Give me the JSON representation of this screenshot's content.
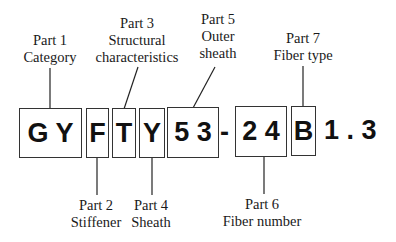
{
  "code": "GYFTY53-24B1.3",
  "segments": {
    "gy": "G Y",
    "f": "F",
    "t": "T",
    "y": "Y",
    "n53": "5 3",
    "dash": "-",
    "n24": "2 4",
    "b": "B",
    "tail": "1 . 3"
  },
  "parts": {
    "p1": {
      "name": "Part 1",
      "desc": "Category",
      "segment": "GY"
    },
    "p2": {
      "name": "Part 2",
      "desc": "Stiffener",
      "segment": "F"
    },
    "p3": {
      "name": "Part 3",
      "desc1": "Structural",
      "desc2": "characteristics",
      "segment": "T"
    },
    "p4": {
      "name": "Part 4",
      "desc": "Sheath",
      "segment": "Y"
    },
    "p5": {
      "name": "Part 5",
      "desc1": "Outer",
      "desc2": "sheath",
      "segment": "53"
    },
    "p6": {
      "name": "Part 6",
      "desc": "Fiber number",
      "segment": "24"
    },
    "p7": {
      "name": "Part 7",
      "desc": "Fiber type",
      "segment": "B1.3"
    }
  }
}
